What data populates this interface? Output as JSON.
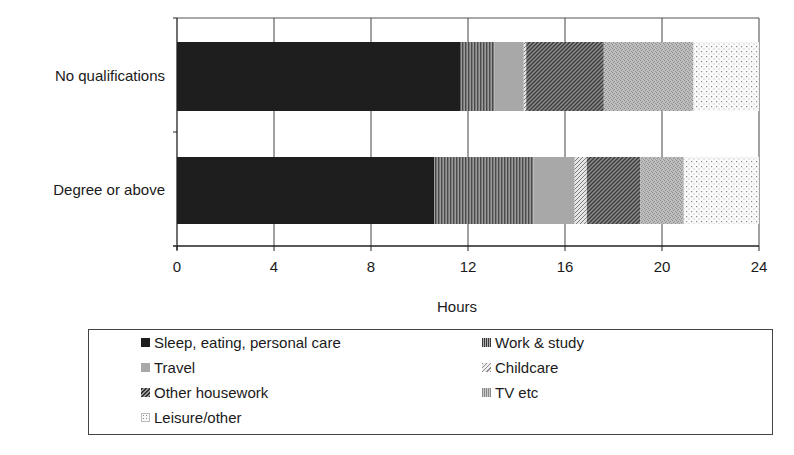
{
  "chart_data": {
    "type": "bar",
    "orientation": "horizontal",
    "stacked": true,
    "title": "",
    "xlabel": "Hours",
    "ylabel": "",
    "xlim": [
      0,
      24
    ],
    "xticks": [
      "0",
      "4",
      "8",
      "12",
      "16",
      "20",
      "24"
    ],
    "grid": {
      "vertical": true,
      "horizontal": false
    },
    "legend_position": "bottom",
    "categories": [
      "No qualifications",
      "Degree or above"
    ],
    "series": [
      {
        "name": "Sleep, eating, personal care",
        "values": [
          11.7,
          10.6
        ],
        "color": "#1e1e1e",
        "pattern": "solid"
      },
      {
        "name": "Work & study",
        "values": [
          1.4,
          4.1
        ],
        "color": "#7a7a7a",
        "pattern": "vertical-lines"
      },
      {
        "name": "Travel",
        "values": [
          1.2,
          1.7
        ],
        "color": "#a8a8a8",
        "pattern": "solid"
      },
      {
        "name": "Childcare",
        "values": [
          0.1,
          0.5
        ],
        "color": "#c8c8c8",
        "pattern": "light-diagonal"
      },
      {
        "name": "Other housework",
        "values": [
          3.2,
          2.2
        ],
        "color": "#6a6a6a",
        "pattern": "dark-diagonal"
      },
      {
        "name": "TV etc",
        "values": [
          3.7,
          1.8
        ],
        "color": "#b4b4b4",
        "pattern": "speckle"
      },
      {
        "name": "Leisure/other",
        "values": [
          2.7,
          3.1
        ],
        "color": "#f2f2f2",
        "pattern": "dots"
      }
    ]
  },
  "legend": {
    "items": [
      {
        "label": "Sleep, eating, personal care",
        "col": 0,
        "row": 0
      },
      {
        "label": "Work & study",
        "col": 1,
        "row": 0
      },
      {
        "label": "Travel",
        "col": 0,
        "row": 1
      },
      {
        "label": "Childcare",
        "col": 1,
        "row": 1
      },
      {
        "label": "Other housework",
        "col": 0,
        "row": 2
      },
      {
        "label": "TV etc",
        "col": 1,
        "row": 2
      },
      {
        "label": "Leisure/other",
        "col": 0,
        "row": 3
      }
    ]
  }
}
